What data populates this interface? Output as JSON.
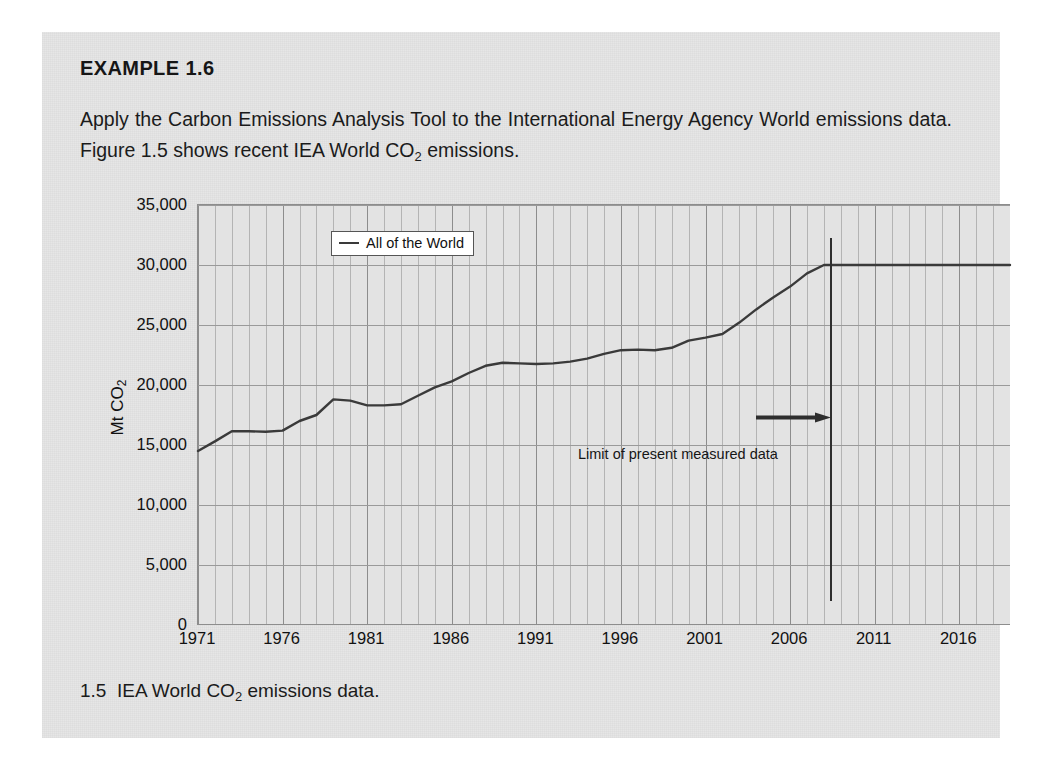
{
  "example": {
    "heading": "EXAMPLE 1.6",
    "body_part1": "Apply the Carbon Emissions Analysis Tool to the International Energy Agency World emissions data. Figure 1.5 shows recent IEA World CO",
    "body_sub": "2",
    "body_part2": " emissions."
  },
  "caption": {
    "number": "1.5",
    "text_part1": "IEA World CO",
    "text_sub": "2",
    "text_part2": " emissions data."
  },
  "annotation": {
    "limit_label": "Limit of present measured data"
  },
  "chart_data": {
    "type": "line",
    "title": "",
    "xlabel": "",
    "ylabel_part1": "Mt CO",
    "ylabel_sub": "2",
    "ylabel": "Mt CO2",
    "xlim": [
      1971,
      2019
    ],
    "ylim": [
      0,
      35000
    ],
    "grid": true,
    "legend_position": "top-left",
    "series": [
      {
        "name": "All of the World",
        "color": "#3a3a3a",
        "x": [
          1971,
          1972,
          1973,
          1974,
          1975,
          1976,
          1977,
          1978,
          1979,
          1980,
          1981,
          1982,
          1983,
          1984,
          1985,
          1986,
          1987,
          1988,
          1989,
          1990,
          1991,
          1992,
          1993,
          1994,
          1995,
          1996,
          1997,
          1998,
          1999,
          2000,
          2001,
          2002,
          2003,
          2004,
          2005,
          2006,
          2007,
          2008,
          2009,
          2010,
          2011,
          2012,
          2013,
          2014,
          2015,
          2016,
          2017,
          2018,
          2019
        ],
        "values": [
          14500,
          15300,
          16150,
          16150,
          16100,
          16200,
          17000,
          17500,
          18800,
          18700,
          18300,
          18300,
          18400,
          19100,
          19800,
          20300,
          21000,
          21600,
          21850,
          21800,
          21750,
          21800,
          21950,
          22200,
          22600,
          22900,
          22950,
          22900,
          23100,
          23700,
          23950,
          24250,
          25200,
          26300,
          27300,
          28200,
          29300,
          30000,
          30000,
          30000,
          30000,
          30000,
          30000,
          30000,
          30000,
          30000,
          30000,
          30000,
          30000
        ]
      }
    ],
    "yticks": [
      {
        "value": 0,
        "label": "0"
      },
      {
        "value": 5000,
        "label": "5,000"
      },
      {
        "value": 10000,
        "label": "10,000"
      },
      {
        "value": 15000,
        "label": "15,000"
      },
      {
        "value": 20000,
        "label": "20,000"
      },
      {
        "value": 25000,
        "label": "25,000"
      },
      {
        "value": 30000,
        "label": "30,000"
      },
      {
        "value": 35000,
        "label": "35,000"
      }
    ],
    "xticks": [
      {
        "value": 1971,
        "label": "1971"
      },
      {
        "value": 1976,
        "label": "1976"
      },
      {
        "value": 1981,
        "label": "1981"
      },
      {
        "value": 1986,
        "label": "1986"
      },
      {
        "value": 1991,
        "label": "1991"
      },
      {
        "value": 1996,
        "label": "1996"
      },
      {
        "value": 2001,
        "label": "2001"
      },
      {
        "value": 2006,
        "label": "2006"
      },
      {
        "value": 2011,
        "label": "2011"
      },
      {
        "value": 2016,
        "label": "2016"
      }
    ],
    "annotations": [
      {
        "type": "vline",
        "x": 2008.4,
        "label": "Limit of present measured data",
        "color": "#2e2e2e"
      }
    ],
    "legend": [
      {
        "label": "All of the World",
        "color": "#3a3a3a"
      }
    ]
  }
}
